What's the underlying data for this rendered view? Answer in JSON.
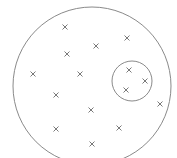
{
  "diagram": {
    "width": 177,
    "height": 158,
    "background": "#ffffff",
    "stroke_color": "#8a8a8a",
    "mark_color": "#6a6a6a",
    "large_circle": {
      "cx": 92,
      "cy": 86,
      "r": 79
    },
    "small_circle": {
      "cx": 132,
      "cy": 81,
      "r": 20
    },
    "marks": [
      {
        "x": 65,
        "y": 27,
        "inside_small_circle": false
      },
      {
        "x": 127,
        "y": 38,
        "inside_small_circle": false
      },
      {
        "x": 96,
        "y": 46,
        "inside_small_circle": false
      },
      {
        "x": 67,
        "y": 54,
        "inside_small_circle": false
      },
      {
        "x": 33,
        "y": 74,
        "inside_small_circle": false
      },
      {
        "x": 80,
        "y": 74,
        "inside_small_circle": false
      },
      {
        "x": 129,
        "y": 70,
        "inside_small_circle": true
      },
      {
        "x": 145,
        "y": 81,
        "inside_small_circle": true
      },
      {
        "x": 126,
        "y": 90,
        "inside_small_circle": true
      },
      {
        "x": 56,
        "y": 95,
        "inside_small_circle": false
      },
      {
        "x": 160,
        "y": 104,
        "inside_small_circle": false
      },
      {
        "x": 91,
        "y": 110,
        "inside_small_circle": false
      },
      {
        "x": 119,
        "y": 128,
        "inside_small_circle": false
      },
      {
        "x": 56,
        "y": 129,
        "inside_small_circle": false
      },
      {
        "x": 92,
        "y": 144,
        "inside_small_circle": false
      }
    ],
    "mark_symbol": "x-mark",
    "mark_size": 5
  }
}
